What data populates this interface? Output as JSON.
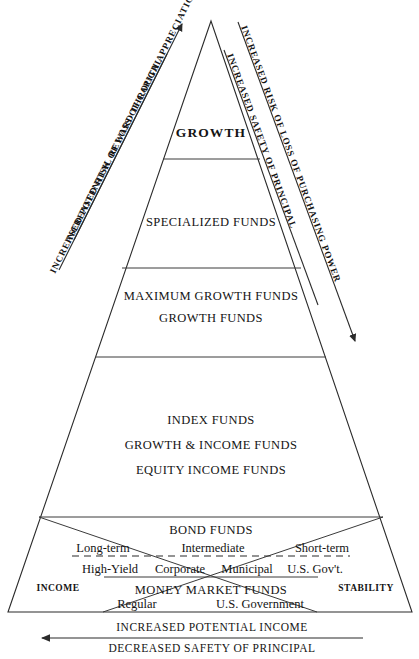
{
  "diagram": {
    "apex_tier": "GROWTH",
    "tiers": [
      {
        "id": "growth",
        "lines": [
          "GROWTH"
        ],
        "bold": true
      },
      {
        "id": "specialized",
        "lines": [
          "SPECIALIZED FUNDS"
        ],
        "bold": false
      },
      {
        "id": "maximum-growth",
        "lines": [
          "MAXIMUM GROWTH FUNDS",
          "GROWTH FUNDS"
        ],
        "bold": false
      },
      {
        "id": "index",
        "lines": [
          "INDEX FUNDS",
          "GROWTH & INCOME FUNDS",
          "EQUITY INCOME FUNDS"
        ],
        "bold": false
      },
      {
        "id": "bond",
        "lines": [
          "BOND FUNDS"
        ],
        "bold": false
      },
      {
        "id": "money-market",
        "lines": [
          "MONEY MARKET FUNDS"
        ],
        "bold": false
      }
    ],
    "bond_maturities": [
      "Long-term",
      "Intermediate",
      "Short-term"
    ],
    "bond_types": [
      "High-Yield",
      "Corporate",
      "Municipal",
      "U.S. Gov't."
    ],
    "money_market_types": [
      "Regular",
      "U.S. Government"
    ],
    "corner_left": "INCOME",
    "corner_right": "STABILITY",
    "left_axis": {
      "line1": "INCREASED RISK OF LOSS OF CAPITAL",
      "line2": "INCREASED POTENTIAL REWARD THROUGH APPRECIATION",
      "arrow": "up-arrow-icon"
    },
    "right_axis": {
      "line1": "INCREASED RISK OF LOSS OF PURCHASING POWER",
      "line2": "INCREASED SAFETY OF PRINCIPAL",
      "arrow": "down-arrow-icon"
    },
    "bottom_axis": {
      "line1": "INCREASED POTENTIAL INCOME",
      "line2": "DECREASED SAFETY OF PRINCIPAL",
      "arrow": "left-arrow-icon"
    },
    "colors": {
      "ink": "#141414",
      "stroke": "#2b2b2b",
      "background": "#ffffff"
    }
  }
}
